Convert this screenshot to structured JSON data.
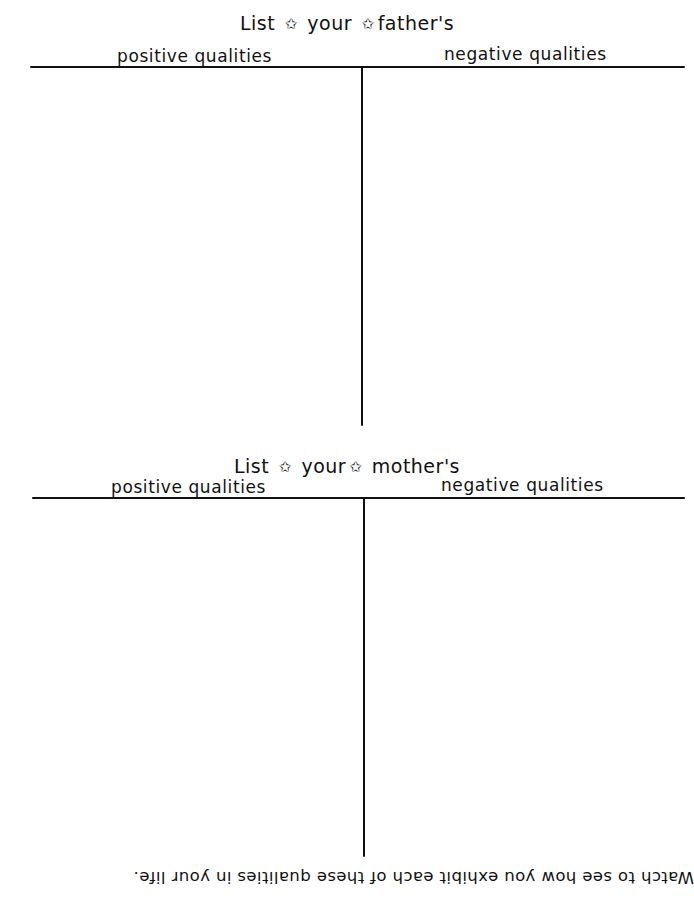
{
  "worksheet": {
    "sections": [
      {
        "id": "father",
        "title": {
          "words": [
            "List",
            "your",
            "father's"
          ],
          "star_glyph": "✩"
        },
        "columns": [
          {
            "label": "positive qualities",
            "entries": []
          },
          {
            "label": "negative qualities",
            "entries": []
          }
        ]
      },
      {
        "id": "mother",
        "title": {
          "words": [
            "List",
            "your",
            "mother's"
          ],
          "star_glyph": "✩"
        },
        "columns": [
          {
            "label": "positive qualities",
            "entries": []
          },
          {
            "label": "negative qualities",
            "entries": []
          }
        ]
      }
    ],
    "footer": {
      "text": "Watch to see how you exhibit each of these qualities in your life.",
      "orientation": "upside-down"
    },
    "colors": {
      "ink": "#111111",
      "paper": "#ffffff"
    }
  }
}
